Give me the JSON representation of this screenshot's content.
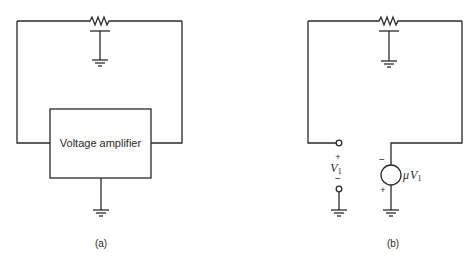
{
  "diagrams": [
    {
      "id": "a",
      "caption": "(a)",
      "block_label": "Voltage amplifier",
      "components": [
        "resistor",
        "capacitor-to-ground",
        "voltage-amplifier-block",
        "ground"
      ]
    },
    {
      "id": "b",
      "caption": "(b)",
      "input": {
        "plus": "+",
        "symbol": "V",
        "subscript": "1",
        "minus": "−"
      },
      "source": {
        "prefix": "μ",
        "symbol": "V",
        "subscript": "1",
        "top_polarity": "−",
        "bottom_polarity": "+"
      },
      "components": [
        "resistor",
        "capacitor-to-ground",
        "input-terminals",
        "dependent-voltage-source",
        "ground",
        "ground"
      ]
    }
  ],
  "colors": {
    "line": "#2a2a2a",
    "background": "#ffffff"
  }
}
